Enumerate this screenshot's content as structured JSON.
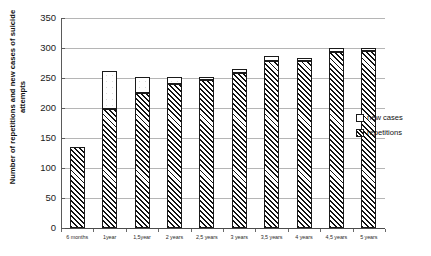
{
  "chart_data": {
    "type": "bar",
    "stacked": true,
    "title": "",
    "xlabel": "",
    "ylabel": "Number of repetitions and new cases of suicide attempts",
    "ylim": [
      0,
      350
    ],
    "ytick_step": 50,
    "yticks": [
      350,
      300,
      250,
      200,
      150,
      100,
      50,
      0
    ],
    "grid": true,
    "legend_position": "right",
    "categories": [
      "6 months",
      "1year",
      "1,5year",
      "2 years",
      "2,5 years",
      "3 years",
      "3,5 years",
      "4 years",
      "4,5 years",
      "5 years"
    ],
    "series": [
      {
        "name": "repetitions",
        "pattern": "diagonal-hatch",
        "values": [
          135,
          198,
          225,
          240,
          246,
          258,
          278,
          278,
          293,
          295
        ]
      },
      {
        "name": "new cases",
        "pattern": "light-dots",
        "values": [
          0,
          64,
          26,
          12,
          6,
          7,
          9,
          6,
          7,
          5
        ]
      }
    ],
    "totals": [
      135,
      262,
      251,
      252,
      252,
      265,
      287,
      284,
      300,
      300
    ]
  },
  "axes": {
    "y_title": "Number of repetitions and new cases of suicide attempts",
    "y_tick_labels": [
      "350",
      "300",
      "250",
      "200",
      "150",
      "100",
      "50",
      "0"
    ]
  },
  "legend": {
    "items": [
      {
        "label": "new cases",
        "swatch": "empty-square"
      },
      {
        "label": "repetitions",
        "swatch": "hatched-square"
      }
    ]
  }
}
